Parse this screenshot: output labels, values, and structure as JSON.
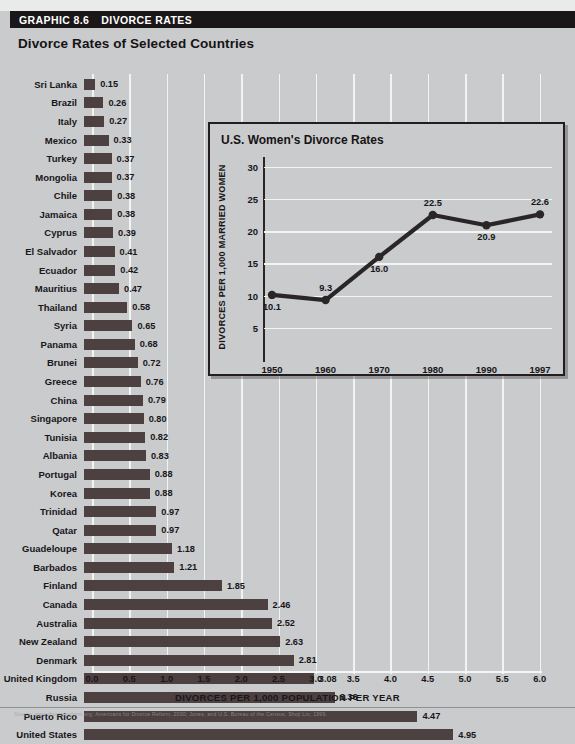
{
  "header": {
    "graphic_label": "GRAPHIC 8.6",
    "graphic_title": "DIVORCE RATES"
  },
  "subtitle": "Divorce Rates of Selected Countries",
  "footer_source": "Source: www.divorcereform.org; Americans for Divorce Reform, 2000; Jones, and U.S. Bureau of the Census, Shoji Lin, 1999.",
  "chart_data": [
    {
      "type": "bar",
      "orientation": "horizontal",
      "title": "Divorce Rates of Selected Countries",
      "xlabel": "DIVORCES PER 1,000 POPULATION PER YEAR",
      "ylabel": "",
      "xlim": [
        0.0,
        6.0
      ],
      "xticks": [
        "0.0",
        "0.5",
        "1.0",
        "1.5",
        "2.0",
        "2.5",
        "3.0",
        "3.5",
        "4.0",
        "4.5",
        "5.0",
        "5.5",
        "6.0"
      ],
      "grid": true,
      "legend": "none",
      "bar_color": "#4d4041",
      "categories": [
        "Sri Lanka",
        "Brazil",
        "Italy",
        "Mexico",
        "Turkey",
        "Mongolia",
        "Chile",
        "Jamaica",
        "Cyprus",
        "El Salvador",
        "Ecuador",
        "Mauritius",
        "Thailand",
        "Syria",
        "Panama",
        "Brunei",
        "Greece",
        "China",
        "Singapore",
        "Tunisia",
        "Albania",
        "Portugal",
        "Korea",
        "Trinidad",
        "Qatar",
        "Guadeloupe",
        "Barbados",
        "Finland",
        "Canada",
        "Australia",
        "New Zealand",
        "Denmark",
        "United Kingdom",
        "Russia",
        "Puerto Rico",
        "United States"
      ],
      "values": [
        0.15,
        0.26,
        0.27,
        0.33,
        0.37,
        0.37,
        0.38,
        0.38,
        0.39,
        0.41,
        0.42,
        0.47,
        0.58,
        0.65,
        0.68,
        0.72,
        0.76,
        0.79,
        0.8,
        0.82,
        0.83,
        0.88,
        0.88,
        0.97,
        0.97,
        1.18,
        1.21,
        1.85,
        2.46,
        2.52,
        2.63,
        2.81,
        3.08,
        3.36,
        4.47,
        4.95
      ],
      "value_labels": [
        "0.15",
        "0.26",
        "0.27",
        "0.33",
        "0.37",
        "0.37",
        "0.38",
        "0.38",
        "0.39",
        "0.41",
        "0.42",
        "0.47",
        "0.58",
        "0.65",
        "0.68",
        "0.72",
        "0.76",
        "0.79",
        "0.80",
        "0.82",
        "0.83",
        "0.88",
        "0.88",
        "0.97",
        "0.97",
        "1.18",
        "1.21",
        "1.85",
        "2.46",
        "2.52",
        "2.63",
        "2.81",
        "3.08",
        "3.36",
        "4.47",
        "4.95"
      ]
    },
    {
      "type": "line",
      "title": "U.S. Women's Divorce Rates",
      "xlabel": "",
      "ylabel": "DIVORCES PER 1,000 MARRIED WOMEN",
      "x": [
        "1950",
        "1960",
        "1970",
        "1980",
        "1990",
        "1997"
      ],
      "values": [
        10.1,
        9.3,
        16.0,
        22.5,
        20.9,
        22.6
      ],
      "value_labels": [
        "10.1",
        "9.3",
        "16.0",
        "22.5",
        "20.9",
        "22.6"
      ],
      "ylim": [
        0,
        30
      ],
      "yticks": [
        "30",
        "25",
        "20",
        "15",
        "10",
        "5"
      ],
      "ytick_values": [
        30,
        25,
        20,
        15,
        10,
        5
      ],
      "grid": true,
      "legend": "none",
      "line_color": "#2a2627",
      "marker": "circle"
    }
  ]
}
